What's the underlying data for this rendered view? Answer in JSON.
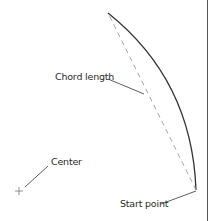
{
  "diagram": {
    "labels": {
      "chord_length": "Chord length",
      "center": "Center",
      "start_point": "Start point"
    },
    "elements": {
      "arc": {
        "style": "solid",
        "color": "#333333",
        "from": [
          196,
          190
        ],
        "to": [
          108,
          13
        ]
      },
      "chord": {
        "style": "dashed",
        "color": "#9a9a9a",
        "from": [
          196,
          190
        ],
        "to": [
          108,
          13
        ]
      },
      "center_marker": {
        "symbol": "+",
        "position": [
          19,
          191
        ],
        "color": "#777777"
      },
      "right_border": {
        "x": 207,
        "color": "#555555"
      }
    },
    "colors": {
      "text": "#2a2a2a",
      "arc": "#333333",
      "chord": "#9a9a9a",
      "leader": "#333333",
      "background": "#ffffff"
    }
  }
}
